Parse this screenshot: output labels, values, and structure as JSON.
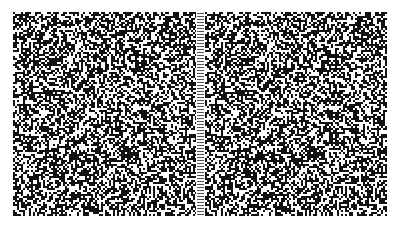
{
  "figure": {
    "type": "random-dot stereogram pair",
    "background": "#ffffff",
    "dot_color": "#111111",
    "panels": [
      {
        "id": "left",
        "x": 13,
        "y": 12,
        "width": 183,
        "height": 204,
        "seed": 7,
        "density": 0.55
      },
      {
        "id": "right",
        "x": 205,
        "y": 12,
        "width": 182,
        "height": 204,
        "seed": 7,
        "density": 0.55,
        "shifted_region": {
          "x": 50,
          "y": 50,
          "w": 80,
          "h": 100,
          "dx": -3
        }
      }
    ],
    "divider": {
      "x": 196,
      "width": 9,
      "tick_spacing": 3,
      "tick_color": "#555555"
    },
    "dot_size": 2
  }
}
